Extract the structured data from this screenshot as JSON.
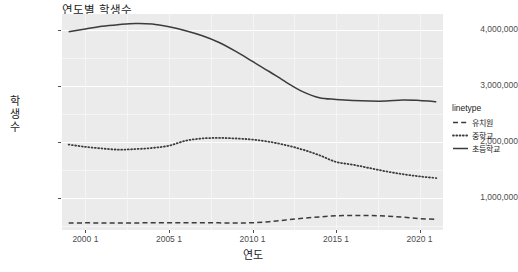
{
  "chart_data": {
    "type": "line",
    "title": "연도별 학생수",
    "xlabel": "연도",
    "ylabel": "학생수",
    "grid": true,
    "legend_position": "right",
    "legend_title": "linetype",
    "xlim": [
      1998.6,
      2021.4
    ],
    "ylim": [
      420000,
      4290000
    ],
    "xticks": [
      2000,
      2005,
      2010,
      2015,
      2020
    ],
    "xtick_labels": [
      "2000 1",
      "2005 1",
      "2010 1",
      "2015 1",
      "2020 1"
    ],
    "yticks": [
      1000000,
      2000000,
      3000000,
      4000000
    ],
    "ytick_labels": [
      "1,000,000",
      "2,000,000",
      "3,000,000",
      "4,000,000"
    ],
    "x": [
      1999,
      2000,
      2001,
      2002,
      2003,
      2004,
      2005,
      2006,
      2007,
      2008,
      2009,
      2010,
      2011,
      2012,
      2013,
      2014,
      2015,
      2016,
      2017,
      2018,
      2019,
      2020,
      2021
    ],
    "series": [
      {
        "name": "초등학교",
        "linetype": "solid",
        "color": "#3b3b3b",
        "values": [
          3970000,
          4020000,
          4070000,
          4100000,
          4120000,
          4110000,
          4060000,
          3990000,
          3900000,
          3780000,
          3620000,
          3440000,
          3260000,
          3070000,
          2900000,
          2790000,
          2760000,
          2740000,
          2730000,
          2730000,
          2750000,
          2740000,
          2720000
        ]
      },
      {
        "name": "중학교",
        "linetype": "dotted",
        "color": "#3b3b3b",
        "values": [
          1950000,
          1910000,
          1880000,
          1860000,
          1870000,
          1890000,
          1930000,
          2020000,
          2060000,
          2070000,
          2060000,
          2040000,
          2000000,
          1940000,
          1860000,
          1760000,
          1640000,
          1590000,
          1530000,
          1470000,
          1420000,
          1380000,
          1350000
        ]
      },
      {
        "name": "유치원",
        "linetype": "dashed",
        "color": "#3b3b3b",
        "values": [
          545000,
          548000,
          546000,
          545000,
          547000,
          549000,
          550000,
          552000,
          551000,
          548000,
          545000,
          550000,
          570000,
          600000,
          630000,
          655000,
          675000,
          680000,
          680000,
          670000,
          650000,
          625000,
          610000
        ]
      }
    ]
  },
  "legend": {
    "title": "linetype",
    "items": [
      {
        "label": "유치원",
        "linetype": "dashed"
      },
      {
        "label": "중학교",
        "linetype": "dotted"
      },
      {
        "label": "초등학교",
        "linetype": "solid"
      }
    ]
  }
}
